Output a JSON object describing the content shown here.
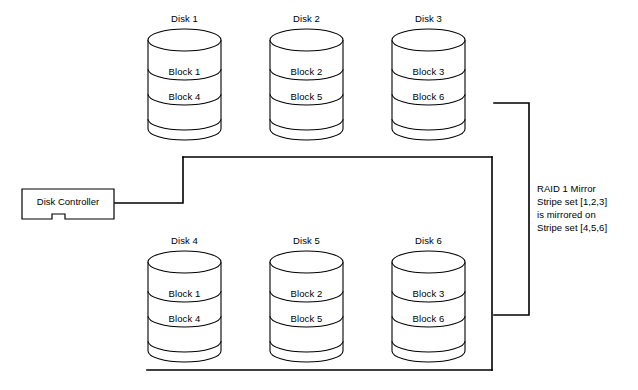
{
  "diagram": {
    "title_text": "RAID 1 Mirror Stripe set [1,2,3] is mirrored on Stripe set [4,5,6]",
    "stroke_color": "#000000",
    "background_color": "#ffffff",
    "controller": {
      "label": "Disk Controller"
    },
    "annotation": {
      "line1": "RAID 1 Mirror",
      "line2": "Stripe set [1,2,3]",
      "line3": "is mirrored on",
      "line4": "Stripe set [4,5,6]"
    },
    "top_row": [
      {
        "name": "Disk 1",
        "blocks": [
          "Block 1",
          "Block 4"
        ],
        "x": 147,
        "y": 13
      },
      {
        "name": "Disk 2",
        "blocks": [
          "Block 2",
          "Block 5"
        ],
        "x": 269,
        "y": 13
      },
      {
        "name": "Disk 3",
        "blocks": [
          "Block 3",
          "Block 6"
        ],
        "x": 391,
        "y": 13
      }
    ],
    "bottom_row": [
      {
        "name": "Disk 4",
        "blocks": [
          "Block 1",
          "Block 4"
        ],
        "x": 147,
        "y": 235
      },
      {
        "name": "Disk 5",
        "blocks": [
          "Block 2",
          "Block 5"
        ],
        "x": 269,
        "y": 235
      },
      {
        "name": "Disk 6",
        "blocks": [
          "Block 3",
          "Block 6"
        ],
        "x": 391,
        "y": 235
      }
    ]
  }
}
